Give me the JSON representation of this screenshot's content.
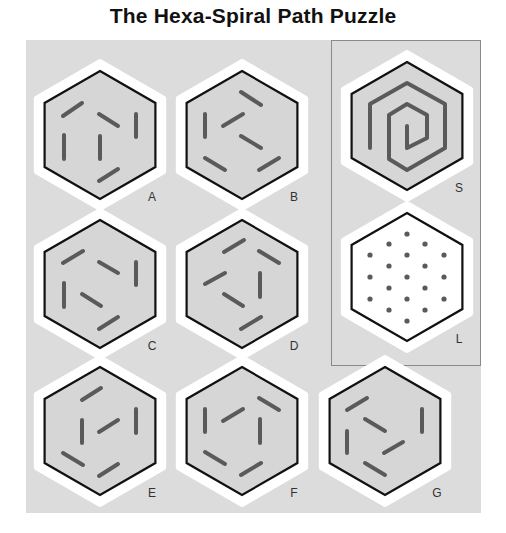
{
  "title": "The Hexa-Spiral Path Puzzle",
  "colors": {
    "panel": "#dcdcdc",
    "halo": "#ffffff",
    "hex_fill_gray": "#d6d6d6",
    "hex_fill_white": "#ffffff",
    "hex_stroke": "#111111",
    "segment": "#5a5a5a",
    "dot": "#5a5a5a"
  },
  "hexagons": [
    {
      "id": "A",
      "label": "A",
      "cx": 100,
      "cy": 135,
      "fill": "gray",
      "segments": [
        [
          -37,
          -19,
          -18,
          -32
        ],
        [
          -1,
          -21,
          18,
          -9
        ],
        [
          36,
          -21,
          36,
          2
        ],
        [
          -36,
          0,
          -36,
          24
        ],
        [
          0,
          1,
          0,
          24
        ],
        [
          -1,
          46,
          18,
          34
        ]
      ]
    },
    {
      "id": "B",
      "label": "B",
      "cx": 242,
      "cy": 135,
      "fill": "gray",
      "segments": [
        [
          -1,
          -43,
          19,
          -30
        ],
        [
          -37,
          -21,
          -37,
          2
        ],
        [
          -19,
          -9,
          1,
          -21
        ],
        [
          -1,
          1,
          19,
          13
        ],
        [
          -37,
          23,
          -17,
          35
        ],
        [
          17,
          35,
          37,
          23
        ]
      ]
    },
    {
      "id": "C",
      "label": "C",
      "cx": 100,
      "cy": 284,
      "fill": "gray",
      "segments": [
        [
          -37,
          -21,
          -17,
          -33
        ],
        [
          -1,
          -22,
          18,
          -11
        ],
        [
          36,
          -22,
          36,
          1
        ],
        [
          -36,
          -1,
          -36,
          23
        ],
        [
          -18,
          10,
          1,
          22
        ],
        [
          -1,
          45,
          18,
          33
        ]
      ]
    },
    {
      "id": "D",
      "label": "D",
      "cx": 242,
      "cy": 284,
      "fill": "gray",
      "segments": [
        [
          -18,
          -32,
          2,
          -44
        ],
        [
          17,
          -33,
          37,
          -21
        ],
        [
          -37,
          0,
          -17,
          -11
        ],
        [
          18,
          -11,
          18,
          13
        ],
        [
          -18,
          10,
          1,
          22
        ],
        [
          -1,
          45,
          19,
          33
        ]
      ]
    },
    {
      "id": "E",
      "label": "E",
      "cx": 100,
      "cy": 431,
      "fill": "gray",
      "segments": [
        [
          -18,
          -31,
          1,
          -43
        ],
        [
          36,
          -22,
          36,
          2
        ],
        [
          -18,
          -11,
          -18,
          12
        ],
        [
          -1,
          1,
          18,
          -11
        ],
        [
          -37,
          22,
          -17,
          34
        ],
        [
          -1,
          45,
          18,
          33
        ]
      ]
    },
    {
      "id": "F",
      "label": "F",
      "cx": 242,
      "cy": 431,
      "fill": "gray",
      "segments": [
        [
          17,
          -33,
          37,
          -21
        ],
        [
          -37,
          -22,
          -37,
          1
        ],
        [
          -19,
          -10,
          1,
          -22
        ],
        [
          18,
          -12,
          18,
          12
        ],
        [
          -37,
          21,
          -17,
          33
        ],
        [
          -1,
          44,
          19,
          32
        ]
      ]
    },
    {
      "id": "G",
      "label": "G",
      "cx": 385,
      "cy": 431,
      "fill": "gray",
      "segments": [
        [
          -38,
          -21,
          -18,
          -33
        ],
        [
          -20,
          -12,
          0,
          0
        ],
        [
          37,
          -22,
          37,
          1
        ],
        [
          -38,
          0,
          -38,
          22
        ],
        [
          -1,
          22,
          18,
          11
        ],
        [
          -20,
          32,
          0,
          44
        ]
      ]
    }
  ],
  "spiral": {
    "id": "S",
    "label": "S",
    "cx": 407,
    "cy": 126,
    "fill": "gray",
    "points": [
      [
        -37,
        22
      ],
      [
        -37,
        -22
      ],
      [
        0,
        -43
      ],
      [
        38,
        -22
      ],
      [
        38,
        22
      ],
      [
        0,
        44
      ],
      [
        -18,
        33
      ],
      [
        -18,
        -11
      ],
      [
        0,
        -22
      ],
      [
        20,
        -11
      ],
      [
        20,
        12
      ],
      [
        0,
        22
      ],
      [
        0,
        0
      ]
    ]
  },
  "lattice": {
    "id": "L",
    "label": "L",
    "cx": 407,
    "cy": 277,
    "fill": "white",
    "dots": [
      [
        0,
        -43
      ],
      [
        -18,
        -33
      ],
      [
        18,
        -33
      ],
      [
        -37,
        -22
      ],
      [
        0,
        -22
      ],
      [
        37,
        -22
      ],
      [
        -18,
        -11
      ],
      [
        18,
        -11
      ],
      [
        -37,
        0
      ],
      [
        0,
        0
      ],
      [
        37,
        0
      ],
      [
        -18,
        11
      ],
      [
        18,
        11
      ],
      [
        -37,
        22
      ],
      [
        0,
        22
      ],
      [
        37,
        22
      ],
      [
        -18,
        33
      ],
      [
        18,
        33
      ],
      [
        0,
        44
      ]
    ]
  },
  "label_offset": [
    52,
    62
  ]
}
